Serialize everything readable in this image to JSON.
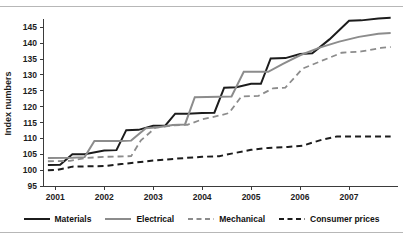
{
  "chart_data": {
    "type": "line",
    "title": "",
    "subtitle": "",
    "xlabel": "",
    "ylabel": "Index numbers",
    "xlim": [
      2000.75,
      2008.0
    ],
    "ylim": [
      95,
      147
    ],
    "grid": false,
    "legend_position": "bottom",
    "y_ticks": [
      95,
      100,
      105,
      110,
      115,
      120,
      125,
      130,
      135,
      140,
      145
    ],
    "y_tick_labels": [
      "95",
      "100",
      "105",
      "110",
      "115",
      "120",
      "125",
      "130",
      "135",
      "140",
      "145"
    ],
    "x_ticks": [
      2001,
      2002,
      2003,
      2004,
      2005,
      2006,
      2007
    ],
    "x_tick_labels": [
      "2001",
      "2002",
      "2003",
      "2004",
      "2005",
      "2006",
      "2007"
    ],
    "colors": {
      "materials": "#1c1c1c",
      "electrical": "#8c8c8c",
      "mechanical": "#8c8c8c",
      "consumer_prices": "#1c1c1c"
    },
    "series": [
      {
        "name": "Materials",
        "style": "solid",
        "color": "#1c1c1c",
        "width": 2.0,
        "x": [
          2000.85,
          2001.1,
          2001.35,
          2001.6,
          2002.0,
          2002.25,
          2002.45,
          2002.7,
          2003.0,
          2003.25,
          2003.45,
          2003.7,
          2004.0,
          2004.25,
          2004.45,
          2004.7,
          2005.0,
          2005.2,
          2005.4,
          2005.7,
          2006.0,
          2006.25,
          2006.6,
          2007.0,
          2007.25,
          2007.6,
          2007.85
        ],
        "y": [
          101.6,
          101.7,
          105.0,
          105.0,
          106.2,
          106.3,
          112.6,
          112.7,
          114.0,
          114.1,
          117.8,
          117.8,
          118.0,
          118.1,
          126.0,
          126.1,
          127.2,
          127.2,
          135.2,
          135.3,
          136.6,
          136.8,
          141.2,
          147.1,
          147.2,
          147.8,
          148.0
        ]
      },
      {
        "name": "Electrical",
        "style": "solid",
        "color": "#8c8c8c",
        "width": 2.0,
        "x": [
          2000.85,
          2001.35,
          2001.6,
          2001.8,
          2002.35,
          2002.55,
          2002.85,
          2003.1,
          2003.4,
          2003.65,
          2003.85,
          2004.35,
          2004.6,
          2004.85,
          2005.15,
          2005.35,
          2005.65,
          2006.0,
          2006.4,
          2006.8,
          2007.2,
          2007.6,
          2007.85
        ],
        "y": [
          103.8,
          103.9,
          104.1,
          109.2,
          109.2,
          109.3,
          113.2,
          113.5,
          114.2,
          114.4,
          123.0,
          123.1,
          123.2,
          131.0,
          131.0,
          131.0,
          133.5,
          136.2,
          138.6,
          140.5,
          142.0,
          143.0,
          143.2
        ]
      },
      {
        "name": "Mechanical",
        "style": "dashed",
        "color": "#8c8c8c",
        "width": 1.8,
        "x": [
          2000.85,
          2001.3,
          2001.6,
          2002.0,
          2002.3,
          2002.55,
          2002.75,
          2003.05,
          2003.4,
          2003.7,
          2004.0,
          2004.35,
          2004.55,
          2004.8,
          2005.15,
          2005.45,
          2005.7,
          2006.05,
          2006.45,
          2006.85,
          2007.25,
          2007.65,
          2007.85
        ],
        "y": [
          102.8,
          102.9,
          103.8,
          104.2,
          104.3,
          104.4,
          109.4,
          113.4,
          114.1,
          114.3,
          116.0,
          117.2,
          118.0,
          123.2,
          123.4,
          125.8,
          126.0,
          132.0,
          134.5,
          137.0,
          137.4,
          138.5,
          138.8
        ]
      },
      {
        "name": "Consumer prices",
        "style": "dashed",
        "color": "#1c1c1c",
        "width": 2.0,
        "x": [
          2000.85,
          2001.05,
          2001.35,
          2002.0,
          2002.35,
          2003.0,
          2003.45,
          2004.0,
          2004.35,
          2004.6,
          2005.0,
          2005.35,
          2005.75,
          2006.05,
          2006.45,
          2006.75,
          2007.2,
          2007.6,
          2007.85
        ],
        "y": [
          100.0,
          100.1,
          101.1,
          101.3,
          101.9,
          103.0,
          103.6,
          104.2,
          104.4,
          105.2,
          106.4,
          107.0,
          107.3,
          107.7,
          109.6,
          110.6,
          110.6,
          110.6,
          110.6
        ]
      }
    ]
  },
  "axis": {
    "y_label": "Index numbers"
  },
  "legend": {
    "items": [
      {
        "label": "Materials",
        "style": "solid",
        "color": "#1c1c1c"
      },
      {
        "label": "Electrical",
        "style": "solid",
        "color": "#8c8c8c"
      },
      {
        "label": "Mechanical",
        "style": "dashed",
        "color": "#8c8c8c"
      },
      {
        "label": "Consumer prices",
        "style": "dashed",
        "color": "#1c1c1c"
      }
    ]
  }
}
